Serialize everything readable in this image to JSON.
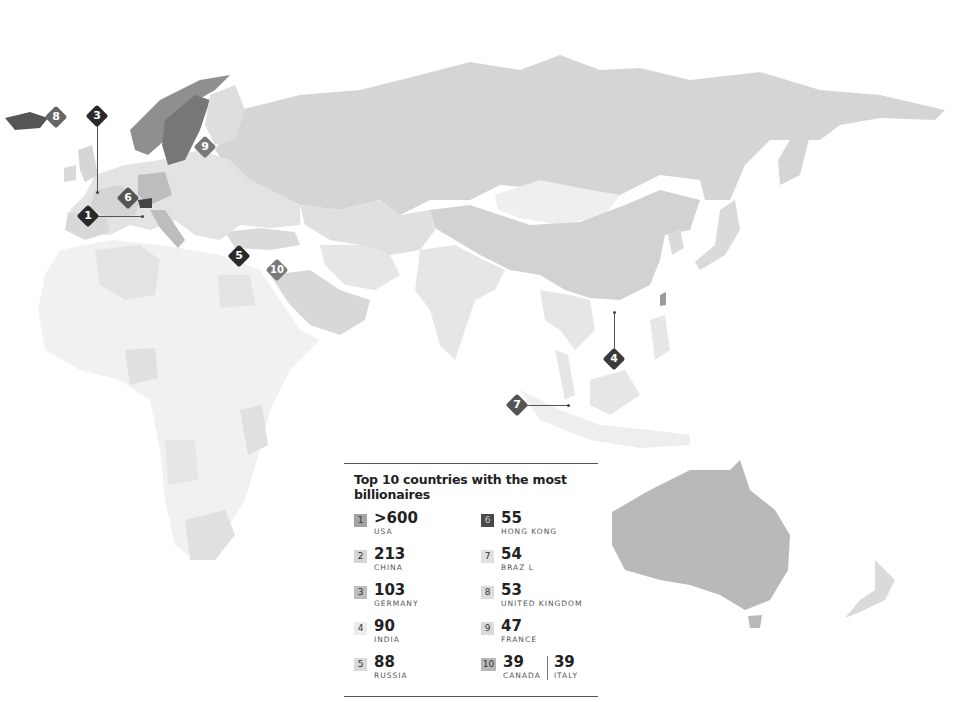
{
  "legend": {
    "title": "Top 10 countries with the most billionaires",
    "entries": [
      {
        "rank": "1",
        "value": ">600",
        "country": "USA",
        "color": "#a3a3a3",
        "text": "#333"
      },
      {
        "rank": "2",
        "value": "213",
        "country": "CHINA",
        "color": "#d6d6d6",
        "text": "#333"
      },
      {
        "rank": "3",
        "value": "103",
        "country": "GERMANY",
        "color": "#bdbdbd",
        "text": "#333"
      },
      {
        "rank": "4",
        "value": "90",
        "country": "INDIA",
        "color": "#e8e8e8",
        "text": "#333"
      },
      {
        "rank": "5",
        "value": "88",
        "country": "RUSSIA",
        "color": "#d9d9d9",
        "text": "#333"
      },
      {
        "rank": "6",
        "value": "55",
        "country": "HONG KONG",
        "color": "#4a4a4a",
        "text": "#ddd"
      },
      {
        "rank": "7",
        "value": "54",
        "country": "BRAZ L",
        "color": "#e0e0e0",
        "text": "#333"
      },
      {
        "rank": "8",
        "value": "53",
        "country": "UNITED KINGDOM",
        "color": "#dcdcdc",
        "text": "#333"
      },
      {
        "rank": "9",
        "value": "47",
        "country": "FRANCE",
        "color": "#dadada",
        "text": "#333"
      },
      {
        "rank": "10",
        "value": "39",
        "country": "CANADA",
        "value2": "39",
        "country2": "ITALY",
        "color": "#b8b8b8",
        "text": "#333"
      }
    ]
  },
  "markers": [
    {
      "label": "1",
      "x": 88,
      "y": 216,
      "color": "#2a2a2a"
    },
    {
      "label": "2",
      "x": -100,
      "y": -100,
      "color": "#2a2a2a"
    },
    {
      "label": "3",
      "x": 97,
      "y": 116,
      "color": "#2a2a2a"
    },
    {
      "label": "4",
      "x": 614,
      "y": 359,
      "color": "#3a3a3a"
    },
    {
      "label": "5",
      "x": 239,
      "y": 256,
      "color": "#2a2a2a"
    },
    {
      "label": "6",
      "x": 128,
      "y": 198,
      "color": "#555555"
    },
    {
      "label": "7",
      "x": 517,
      "y": 405,
      "color": "#555555"
    },
    {
      "label": "8",
      "x": 56,
      "y": 117,
      "color": "#666666"
    },
    {
      "label": "9",
      "x": 205,
      "y": 147,
      "color": "#777777"
    },
    {
      "label": "10",
      "x": 277,
      "y": 270,
      "color": "#7a7a7a"
    }
  ],
  "colors": {
    "russia": "#d5d5d5",
    "china": "#d2d2d2",
    "australia": "#b9b9b9",
    "light_land": "#ececec",
    "mid_land": "#e0e0e0",
    "scandinavia": "#8f8f8f",
    "sweden": "#777777",
    "iceland": "#555555"
  }
}
